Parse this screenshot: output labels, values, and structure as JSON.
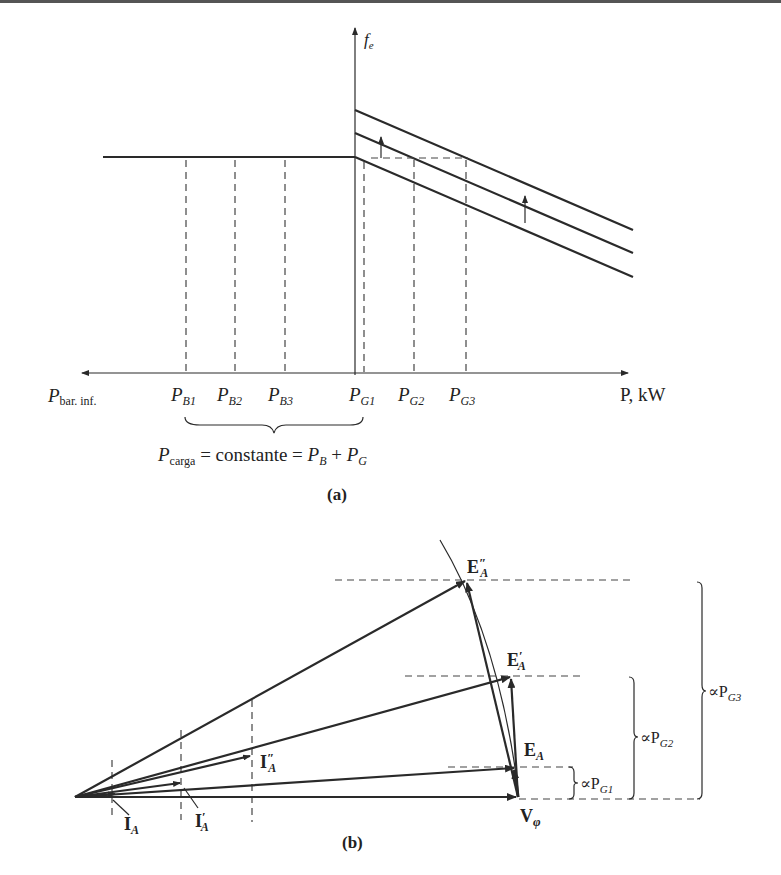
{
  "figure_a": {
    "y_axis_label": "f",
    "y_axis_sub": "e",
    "x_axis_right_label": "P, kW",
    "x_axis_left_label": "P",
    "x_axis_left_sub": "bar. inf.",
    "ticks": [
      {
        "main": "P",
        "sub": "B1"
      },
      {
        "main": "P",
        "sub": "B2"
      },
      {
        "main": "P",
        "sub": "B3"
      },
      {
        "main": "P",
        "sub": "G1"
      },
      {
        "main": "P",
        "sub": "G2"
      },
      {
        "main": "P",
        "sub": "G3"
      }
    ],
    "equation": {
      "p": "P",
      "carga_sub": "carga",
      "middle": " = constante = ",
      "pb": "P",
      "pb_sub": "B",
      "plus": " + ",
      "pg": "P",
      "pg_sub": "G"
    },
    "caption": "(a)"
  },
  "figure_b": {
    "labels": {
      "ea2": {
        "main": "E",
        "sub": "A",
        "prime": "″"
      },
      "ea1": {
        "main": "E",
        "sub": "A",
        "prime": "′"
      },
      "ea": {
        "main": "E",
        "sub": "A"
      },
      "vphi": {
        "main": "V",
        "sub": "φ"
      },
      "ia": {
        "main": "I",
        "sub": "A"
      },
      "ia1": {
        "main": "I",
        "sub": "A",
        "prime": "′"
      },
      "ia2": {
        "main": "I",
        "sub": "A",
        "prime": "″"
      }
    },
    "braces": [
      {
        "prefix": "∝P",
        "sub": "G1"
      },
      {
        "prefix": "∝P",
        "sub": "G2"
      },
      {
        "prefix": "∝P",
        "sub": "G3"
      }
    ],
    "caption": "(b)"
  }
}
